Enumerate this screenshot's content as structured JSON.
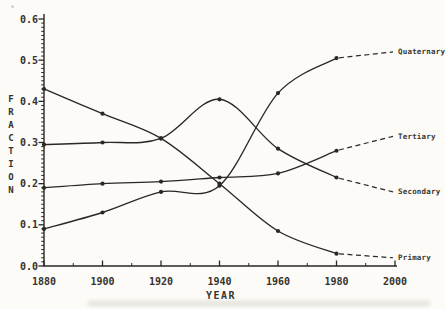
{
  "figure": {
    "background": "#fcfbf8",
    "line_color": "#2a2824",
    "text_color": "#35322d"
  },
  "chart_data": {
    "type": "line",
    "title": "",
    "xlabel": "YEAR",
    "ylabel": "FRACTION",
    "xlim": [
      1880,
      2000
    ],
    "ylim": [
      0.0,
      0.6
    ],
    "x_ticks": [
      1880,
      1900,
      1920,
      1940,
      1960,
      1980,
      2000
    ],
    "y_ticks": [
      "0.0",
      "0.1",
      "0.2",
      "0.3",
      "0.4",
      "0.5",
      "0.6"
    ],
    "grid": "off",
    "legend_position": "line-end-labels-right",
    "x": [
      1880,
      1900,
      1920,
      1940,
      1960,
      1980
    ],
    "projection_x": 2000,
    "series": [
      {
        "name": "Quaternary",
        "values": [
          0.09,
          0.13,
          0.18,
          0.195,
          0.42,
          0.505
        ],
        "projected_2000": 0.52
      },
      {
        "name": "Tertiary",
        "values": [
          0.19,
          0.2,
          0.205,
          0.215,
          0.225,
          0.28
        ],
        "projected_2000": 0.315
      },
      {
        "name": "Secondary",
        "values": [
          0.295,
          0.3,
          0.31,
          0.405,
          0.285,
          0.215
        ],
        "projected_2000": 0.18
      },
      {
        "name": "Primary",
        "values": [
          0.43,
          0.37,
          0.31,
          0.2,
          0.085,
          0.03
        ],
        "projected_2000": 0.02
      }
    ],
    "style_notes": "solid lines with dot markers 1880-1980; dashed projection segments 1980-2000 ending at right-side series labels"
  }
}
